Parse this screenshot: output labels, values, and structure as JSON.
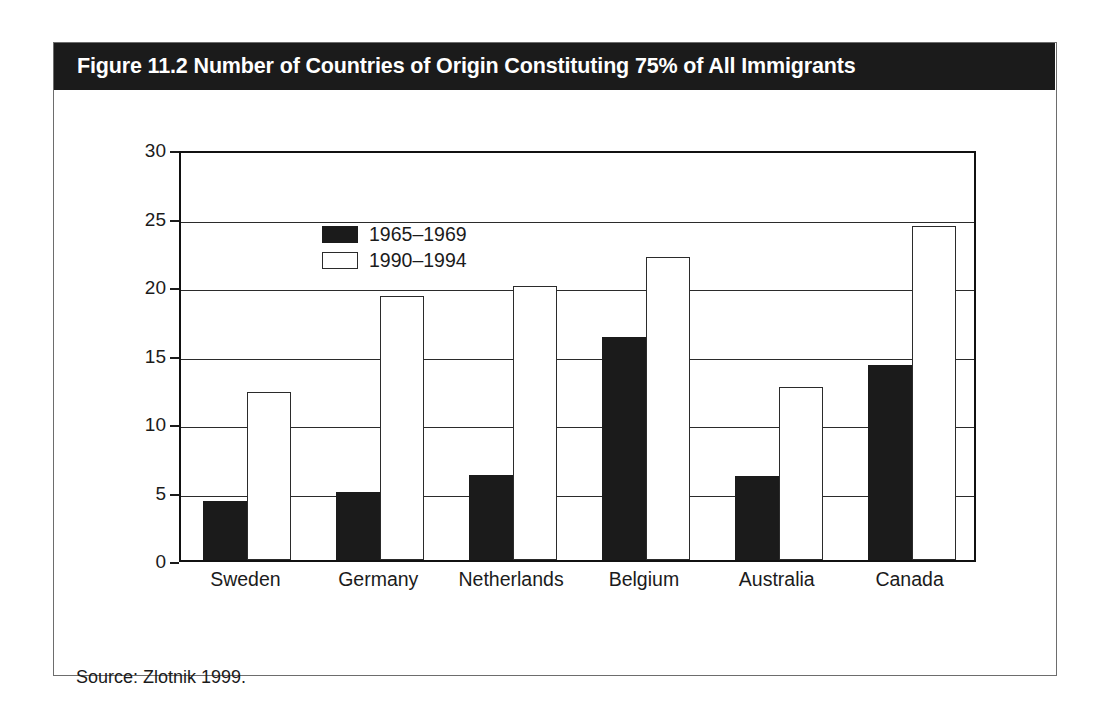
{
  "figure": {
    "title": "Figure 11.2 Number of Countries of Origin Constituting 75% of All Immigrants",
    "source": "Source: Zlotnik 1999.",
    "title_band_color": "#1b1b1b",
    "title_text_color": "#ffffff",
    "frame_color": "#6d6d6d"
  },
  "chart_data": {
    "type": "bar",
    "title": "Figure 11.2 Number of Countries of Origin Constituting 75% of All Immigrants",
    "categories": [
      "Sweden",
      "Germany",
      "Netherlands",
      "Belgium",
      "Australia",
      "Canada"
    ],
    "series": [
      {
        "name": "1965–1969",
        "color": "#1b1b1b",
        "values": [
          4.3,
          5.0,
          6.2,
          16.3,
          6.1,
          14.2
        ]
      },
      {
        "name": "1990–1994",
        "color": "#ffffff",
        "values": [
          12.3,
          19.3,
          20.0,
          22.1,
          12.6,
          24.4
        ]
      }
    ],
    "xlabel": "",
    "ylabel": "",
    "ylim": [
      0,
      30
    ],
    "yticks": [
      0,
      5,
      10,
      15,
      20,
      25,
      30
    ],
    "ytick_labels": [
      "0",
      "5",
      "10",
      "15",
      "20",
      "25",
      "30"
    ],
    "grid": true,
    "legend_position": "top-left-inside"
  }
}
